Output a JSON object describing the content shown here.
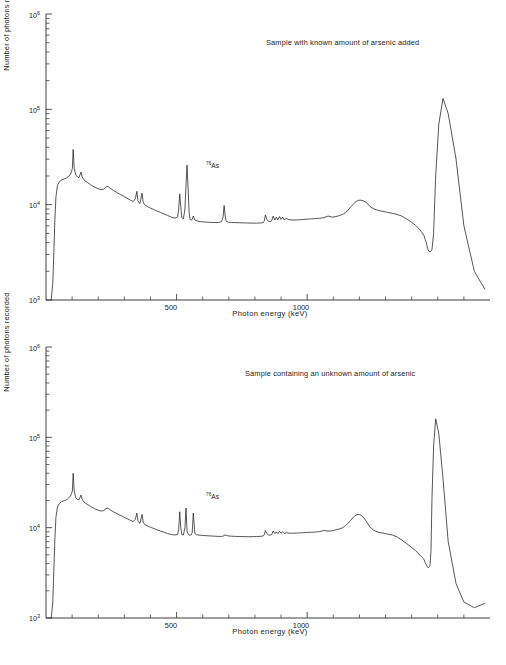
{
  "figure": {
    "panels": [
      {
        "id": "panel-known",
        "caption": "Sample with known amount of arsenic added",
        "annotation": {
          "isotope": "76",
          "element": "As"
        }
      },
      {
        "id": "panel-unknown",
        "caption": "Sample containing an unknown amount of arsenic",
        "annotation": {
          "isotope": "76",
          "element": "As"
        }
      }
    ],
    "axes": {
      "xlabel": "Photon energy  (keV)",
      "ylabel": "Number of photons recorded",
      "x_ticks": [
        {
          "value": 500,
          "label": "500"
        },
        {
          "value": 1000,
          "label": "1000"
        }
      ],
      "x_minor_ticks": [
        100,
        200,
        300,
        400,
        600,
        700,
        800,
        900,
        1100,
        1200,
        1300,
        1400,
        1500,
        1600
      ],
      "y_ticks": [
        {
          "value": 1000,
          "mantissa": "10",
          "exponent": "3"
        },
        {
          "value": 10000,
          "mantissa": "10",
          "exponent": "4"
        },
        {
          "value": 100000,
          "mantissa": "10",
          "exponent": "5"
        },
        {
          "value": 1000000,
          "mantissa": "10",
          "exponent": "6"
        }
      ]
    },
    "colors": {
      "line": "#2b2b2b",
      "axis": "#2b2b2b",
      "background": "#ffffff"
    }
  },
  "chart_data": [
    {
      "type": "line",
      "title": "Sample with known amount of arsenic added",
      "xlabel": "Photon energy  (keV)",
      "ylabel": "Number of photons recorded",
      "xlim": [
        0,
        1700
      ],
      "ylim": [
        1000,
        1000000
      ],
      "yscale": "log",
      "xscale": "linear",
      "grid": false,
      "legend": false,
      "annotations": [
        {
          "text": "76As",
          "x": 560,
          "y": 22000,
          "note": "arsenic-76 photopeak marker"
        }
      ],
      "series": [
        {
          "name": "gamma spectrum (known arsenic)",
          "x": [
            20,
            26,
            30,
            34,
            38,
            44,
            52,
            60,
            70,
            80,
            88,
            94,
            98,
            101,
            104,
            108,
            114,
            120,
            126,
            130,
            134,
            138,
            142,
            146,
            152,
            160,
            170,
            180,
            190,
            200,
            210,
            220,
            228,
            234,
            240,
            248,
            258,
            270,
            282,
            296,
            310,
            322,
            334,
            342,
            348,
            352,
            356,
            360,
            364,
            368,
            372,
            376,
            382,
            390,
            400,
            412,
            424,
            438,
            452,
            466,
            480,
            494,
            504,
            508,
            512,
            516,
            520,
            526,
            532,
            536,
            540,
            544,
            548,
            552,
            556,
            560,
            564,
            570,
            576,
            582,
            590,
            600,
            615,
            630,
            645,
            660,
            672,
            678,
            682,
            686,
            690,
            698,
            710,
            726,
            742,
            758,
            774,
            790,
            806,
            818,
            826,
            832,
            836,
            840,
            846,
            852,
            858,
            864,
            870,
            876,
            882,
            888,
            894,
            900,
            906,
            912,
            920,
            930,
            944,
            958,
            972,
            986,
            1000,
            1016,
            1032,
            1048,
            1064,
            1080,
            1096,
            1110,
            1124,
            1136,
            1146,
            1154,
            1160,
            1166,
            1172,
            1178,
            1184,
            1190,
            1196,
            1204,
            1214,
            1226,
            1240,
            1256,
            1272,
            1290,
            1308,
            1326,
            1344,
            1362,
            1380,
            1398,
            1414,
            1428,
            1440,
            1448,
            1452,
            1456,
            1459,
            1461,
            1463,
            1466,
            1470,
            1474,
            1478,
            1484,
            1492,
            1504,
            1520,
            1540,
            1570,
            1600,
            1640,
            1680
          ],
          "y": [
            1000,
            1500,
            3200,
            7000,
            12000,
            16000,
            17500,
            18200,
            18600,
            19200,
            20000,
            21000,
            22500,
            24000,
            38000,
            24000,
            20500,
            19600,
            19200,
            20500,
            22000,
            19800,
            18800,
            18200,
            17600,
            17000,
            16200,
            15600,
            15100,
            14700,
            14400,
            14500,
            15200,
            15600,
            15300,
            14700,
            14100,
            13500,
            12900,
            12300,
            11700,
            11200,
            10800,
            11500,
            13800,
            11000,
            10500,
            10300,
            11800,
            13200,
            10600,
            10100,
            9800,
            9500,
            9200,
            8900,
            8600,
            8300,
            8000,
            7700,
            7400,
            7200,
            7400,
            9000,
            13000,
            9500,
            7300,
            7100,
            9000,
            16000,
            26000,
            15000,
            8200,
            7000,
            6900,
            7000,
            7600,
            6900,
            6800,
            6700,
            6650,
            6600,
            6560,
            6520,
            6500,
            6500,
            6600,
            7400,
            9800,
            7600,
            6700,
            6550,
            6500,
            6480,
            6460,
            6440,
            6420,
            6400,
            6400,
            6420,
            6450,
            6500,
            6800,
            7800,
            7000,
            6700,
            6600,
            6800,
            7600,
            6900,
            7400,
            6900,
            7500,
            7000,
            7400,
            6900,
            7200,
            6950,
            6900,
            6900,
            6950,
            7000,
            7050,
            7100,
            7150,
            7200,
            7300,
            7600,
            7400,
            7500,
            7700,
            7900,
            8200,
            8600,
            9000,
            9400,
            9800,
            10200,
            10600,
            10900,
            11100,
            11150,
            11000,
            10600,
            9600,
            9000,
            8700,
            8500,
            8300,
            8100,
            7900,
            7600,
            7100,
            6600,
            6100,
            5600,
            5100,
            4700,
            4300,
            4000,
            3700,
            3500,
            3350,
            3250,
            3200,
            3250,
            3400,
            5000,
            20000,
            70000,
            130000,
            90000,
            30000,
            6000,
            2000,
            1300,
            1150,
            1250,
            1700,
            1900,
            1850,
            1830,
            1820,
            1820,
            1810
          ]
        }
      ]
    },
    {
      "type": "line",
      "title": "Sample containing an unknown amount of arsenic",
      "xlabel": "Photon energy  (keV)",
      "ylabel": "Number of photons recorded",
      "xlim": [
        0,
        1700
      ],
      "ylim": [
        1000,
        1000000
      ],
      "yscale": "log",
      "xscale": "linear",
      "grid": false,
      "legend": false,
      "annotations": [
        {
          "text": "76As",
          "x": 560,
          "y": 20000,
          "note": "arsenic-76 photopeak marker"
        }
      ],
      "series": [
        {
          "name": "gamma spectrum (unknown arsenic)",
          "x": [
            20,
            26,
            30,
            34,
            38,
            44,
            52,
            60,
            70,
            80,
            88,
            94,
            98,
            101,
            104,
            108,
            114,
            120,
            126,
            130,
            134,
            138,
            142,
            146,
            152,
            160,
            170,
            180,
            190,
            200,
            210,
            220,
            228,
            234,
            240,
            248,
            258,
            270,
            282,
            296,
            310,
            322,
            334,
            342,
            348,
            352,
            356,
            360,
            364,
            368,
            372,
            376,
            382,
            390,
            400,
            412,
            424,
            438,
            452,
            466,
            480,
            494,
            504,
            508,
            512,
            516,
            520,
            526,
            532,
            536,
            540,
            544,
            548,
            552,
            556,
            560,
            564,
            570,
            576,
            582,
            590,
            600,
            615,
            630,
            645,
            660,
            672,
            678,
            682,
            686,
            690,
            698,
            710,
            726,
            742,
            758,
            774,
            790,
            806,
            818,
            826,
            832,
            836,
            840,
            846,
            852,
            858,
            864,
            870,
            876,
            882,
            888,
            894,
            900,
            906,
            912,
            920,
            930,
            944,
            958,
            972,
            986,
            1000,
            1016,
            1032,
            1048,
            1064,
            1080,
            1096,
            1110,
            1124,
            1136,
            1146,
            1154,
            1160,
            1166,
            1172,
            1178,
            1184,
            1190,
            1196,
            1204,
            1214,
            1226,
            1240,
            1256,
            1272,
            1290,
            1308,
            1326,
            1344,
            1362,
            1380,
            1398,
            1414,
            1428,
            1440,
            1448,
            1452,
            1456,
            1459,
            1461,
            1463,
            1466,
            1470,
            1474,
            1478,
            1484,
            1492,
            1504,
            1520,
            1540,
            1570,
            1600,
            1640,
            1680
          ],
          "y": [
            1000,
            1500,
            3400,
            7500,
            13000,
            17000,
            18600,
            19400,
            19900,
            20500,
            21500,
            22500,
            24000,
            25500,
            40000,
            25500,
            21500,
            20600,
            20200,
            21500,
            23000,
            20800,
            19800,
            19200,
            18600,
            18000,
            17200,
            16600,
            16000,
            15600,
            15300,
            15400,
            16100,
            16500,
            16200,
            15600,
            15000,
            14400,
            13800,
            13200,
            12600,
            12100,
            11700,
            12400,
            14500,
            11900,
            11400,
            11200,
            12600,
            14000,
            11500,
            11000,
            10700,
            10400,
            10100,
            9800,
            9500,
            9200,
            8900,
            8600,
            8400,
            8300,
            8400,
            9600,
            15000,
            10000,
            8400,
            8300,
            10000,
            16500,
            9200,
            8500,
            8300,
            8250,
            8300,
            8900,
            14500,
            8600,
            8350,
            8300,
            8250,
            8200,
            8150,
            8100,
            8050,
            8000,
            8000,
            8050,
            8200,
            8300,
            8200,
            8100,
            8050,
            8000,
            7980,
            7960,
            7940,
            7950,
            7980,
            8000,
            8050,
            8100,
            8400,
            9300,
            8600,
            8300,
            8250,
            8400,
            9200,
            8600,
            9000,
            8600,
            9100,
            8700,
            9000,
            8650,
            8800,
            8700,
            8680,
            8700,
            8750,
            8800,
            8850,
            8900,
            8950,
            9050,
            9300,
            9150,
            9250,
            9450,
            9700,
            10000,
            10500,
            11000,
            11500,
            12000,
            12600,
            13200,
            13600,
            13900,
            14000,
            13800,
            13200,
            11800,
            10200,
            9300,
            8900,
            8700,
            8500,
            8300,
            7900,
            7300,
            6700,
            6100,
            5600,
            5100,
            4700,
            4400,
            4100,
            3900,
            3750,
            3650,
            3600,
            3650,
            3800,
            5500,
            22000,
            80000,
            160000,
            110000,
            35000,
            7000,
            2400,
            1500,
            1300,
            1450,
            2000,
            2250,
            2200,
            2180,
            2170,
            2170,
            2160
          ]
        }
      ]
    }
  ]
}
